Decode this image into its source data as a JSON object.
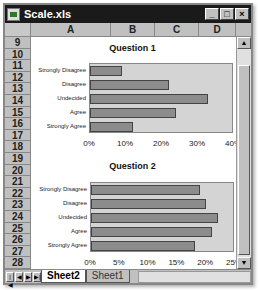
{
  "window": {
    "title": "Scale.xls",
    "minimize": "_",
    "maximize": "□",
    "close": "×"
  },
  "columns": [
    {
      "label": "A",
      "width": 80
    },
    {
      "label": "B",
      "width": 44
    },
    {
      "label": "C",
      "width": 44
    },
    {
      "label": "D",
      "width": 43
    }
  ],
  "rows": [
    "9",
    "10",
    "11",
    "12",
    "13",
    "14",
    "15",
    "16",
    "17",
    "18",
    "19",
    "20",
    "21",
    "22",
    "23",
    "24",
    "25",
    "26",
    "27",
    "28"
  ],
  "sheets": {
    "active": "Sheet2",
    "inactive": "Sheet1"
  },
  "chart_data": [
    {
      "type": "bar",
      "orientation": "horizontal",
      "title": "Question 1",
      "categories": [
        "Strongly Disagree",
        "Disagree",
        "Undecided",
        "Agree",
        "Strongly Agree"
      ],
      "category_labels_display": [
        "Strongly Disagree",
        "Disagree",
        "Undecided",
        "Agree",
        "Strongly Agree"
      ],
      "values": [
        8.8,
        21.9,
        32.8,
        23.9,
        11.9
      ],
      "ticks": [
        "0%",
        "10%",
        "20%",
        "30%",
        "40%"
      ],
      "xlim": [
        0,
        40
      ],
      "xlabel": "",
      "ylabel": "",
      "grid": false,
      "legend": "none"
    },
    {
      "type": "bar",
      "orientation": "horizontal",
      "title": "Question 2",
      "categories": [
        "Strongly Disagree",
        "Disagree",
        "Undecided",
        "Agree",
        "Strongly Agree"
      ],
      "values": [
        18.9,
        20.0,
        22.0,
        21.0,
        18.1
      ],
      "ticks": [
        "0%",
        "5%",
        "10%",
        "15%",
        "20%",
        "25%"
      ],
      "xlim": [
        0,
        25
      ],
      "xlabel": "",
      "ylabel": "",
      "grid": false,
      "legend": "none"
    }
  ]
}
